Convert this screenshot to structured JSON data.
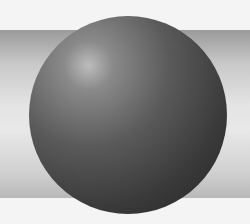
{
  "scene": {
    "description": "Shaded 3D sphere in front of a horizontal cylinder",
    "objects": [
      "sphere",
      "cylinder"
    ],
    "colors": {
      "background": "#f4f4f4",
      "sphere_dark": "#242424",
      "sphere_highlight": "#bdbdbd",
      "cylinder": "#d8d8d8"
    }
  }
}
